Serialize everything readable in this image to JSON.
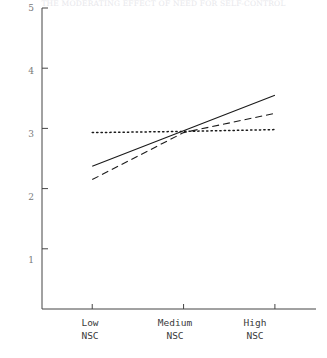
{
  "chart_data": {
    "type": "line",
    "title": "",
    "xlabel": "",
    "ylabel": "",
    "categories": [
      "Low NSC",
      "Medium NSC",
      "High NSC"
    ],
    "x": [
      1,
      2,
      3
    ],
    "ylim": [
      0,
      5
    ],
    "xlim": [
      0.45,
      3.45
    ],
    "yticks": [
      1,
      2,
      3,
      4,
      5
    ],
    "ytick_labels": [
      "1",
      "2",
      "3",
      "4",
      "5"
    ],
    "grid": false,
    "legend": "none",
    "series": [
      {
        "name": "solid-line",
        "style": "solid",
        "values": [
          2.37,
          2.96,
          3.55
        ]
      },
      {
        "name": "dashed-line",
        "style": "dashed",
        "values": [
          2.15,
          2.93,
          3.25
        ]
      },
      {
        "name": "dotted-line",
        "style": "dotted",
        "values": [
          2.93,
          2.95,
          2.98
        ]
      }
    ]
  },
  "header": {
    "title": "THE MODERATING EFFECT OF NEED FOR SELF-CONTROL"
  },
  "axes": {
    "y_ticks": [
      {
        "label": "5",
        "value": 5
      },
      {
        "label": "4",
        "value": 4
      },
      {
        "label": "3",
        "value": 3
      },
      {
        "label": "2",
        "value": 2
      },
      {
        "label": "1",
        "value": 1
      }
    ],
    "x_ticks": [
      {
        "line1": "Low",
        "line2": "NSC",
        "value": 1
      },
      {
        "line1": "Medium",
        "line2": "NSC",
        "value": 2
      },
      {
        "line1": "High",
        "line2": "NSC",
        "value": 3
      }
    ]
  },
  "colors": {
    "axis": "#444444",
    "line": "#1a1a1a",
    "tick_label": "#7a7a7a",
    "background": "#ffffff"
  }
}
